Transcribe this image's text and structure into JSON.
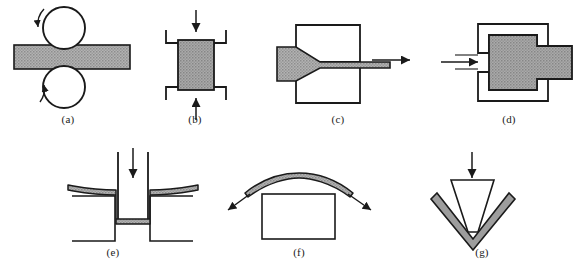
{
  "figure": {
    "background_color": "#ffffff",
    "line_color": "#1a1a1a",
    "workpiece_fill": "#a8a8a8",
    "panel_count": 7
  },
  "panels": [
    {
      "id": "a",
      "caption": "(a)",
      "process_name": "rolling",
      "elements": {
        "tooling": "two cylindrical rolls, upper and lower",
        "workpiece": "horizontal strip passing between rolls",
        "arrows": "curved rotation arrows on both rolls"
      }
    },
    {
      "id": "b",
      "caption": "(b)",
      "process_name": "forging",
      "elements": {
        "tooling": "upper die and lower die with concave recesses",
        "workpiece": "rectangular billet bulging at top and bottom",
        "arrows": "vertical compression arrows from above and below"
      }
    },
    {
      "id": "c",
      "caption": "(c)",
      "process_name": "drawing",
      "elements": {
        "tooling": "upper and lower die blocks with tapered throat",
        "workpiece": "bar reduced in section through the die",
        "arrows": "pull arrow pointing right at exit"
      }
    },
    {
      "id": "d",
      "caption": "(d)",
      "process_name": "extrusion",
      "elements": {
        "tooling": "thick-walled container with die opening at right",
        "workpiece": "billet extruded through the right opening",
        "arrows": "ram arrow pointing right into the container"
      }
    },
    {
      "id": "e",
      "caption": "(e)",
      "process_name": "deep drawing",
      "elements": {
        "tooling": "punch descending into die cavity",
        "workpiece": "sheet drawn into a cup with curved flanges",
        "arrows": "downward punch arrow"
      }
    },
    {
      "id": "f",
      "caption": "(f)",
      "process_name": "stretch forming",
      "elements": {
        "tooling": "rectangular form block",
        "workpiece": "sheet arched over the form block",
        "arrows": "tension arrows pulling outward down-left and down-right"
      }
    },
    {
      "id": "g",
      "caption": "(g)",
      "process_name": "bending",
      "elements": {
        "tooling": "punch above a V-shaped die",
        "workpiece": "sheet bent into a V profile",
        "arrows": "downward punch arrow"
      }
    }
  ],
  "captions": {
    "a": "(a)",
    "b": "(b)",
    "c": "(c)",
    "d": "(d)",
    "e": "(e)",
    "f": "(f)",
    "g": "(g)"
  }
}
